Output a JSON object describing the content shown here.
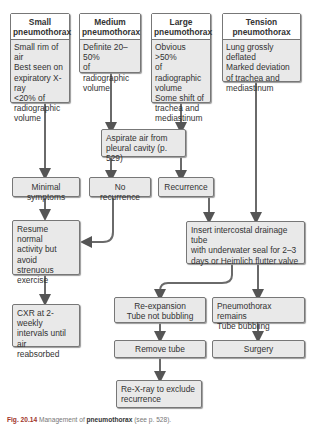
{
  "diagram": {
    "top_boxes": [
      {
        "title": "Small\npneumothorax",
        "title_line1": "Small",
        "title_line2": "pneumothorax",
        "body": "Small rim of air\nBest seen on\nexpiratory X-ray\n<20% of\nradiographic\nvolume"
      },
      {
        "title_line1": "Medium",
        "title_line2": "pneumothorax",
        "body": "Definite 20–50%\nof radiographic\nvolume"
      },
      {
        "title_line1": "Large",
        "title_line2": "pneumothorax",
        "body": "Obvious >50%\nof radiographic\nvolume\nSome shift of\ntrachea and\nmediastinum"
      },
      {
        "title_line1": "Tension",
        "title_line2": "pneumothorax",
        "body": "Lung grossly deflated\nMarked deviation\nof trachea and\nmediastinum"
      }
    ],
    "aspirate": "Aspirate air from\npleural cavity (p. 529)",
    "minimal_symptoms": "Minimal symptoms",
    "no_recurrence": "No recurrence",
    "recurrence": "Recurrence",
    "resume": "Resume normal\nactivity but avoid\nstrenuous\nexercise",
    "insert_tube": "Insert intercostal drainage tube\nwith underwater seal for 2–3\ndays or Heimlich flutter valve",
    "cxr": "CXR at 2-weekly\nintervals until air\nreabsorbed",
    "reexpansion": "Re-expansion\nTube not bubbling",
    "remains": "Pneumothorax remains\nTube bubbling",
    "remove_tube": "Remove tube",
    "surgery": "Surgery",
    "rexray": "Re-X-ray to exclude\nrecurrence"
  },
  "caption": {
    "fig": "Fig. 20.14",
    "text_before": " Management of ",
    "bold": "pneumothorax",
    "text_after": " (see p. 528)."
  },
  "colors": {
    "box_fill": "#e9e9e9",
    "border": "#777777",
    "arrow": "#666666",
    "caption_fig": "#a0342a"
  }
}
